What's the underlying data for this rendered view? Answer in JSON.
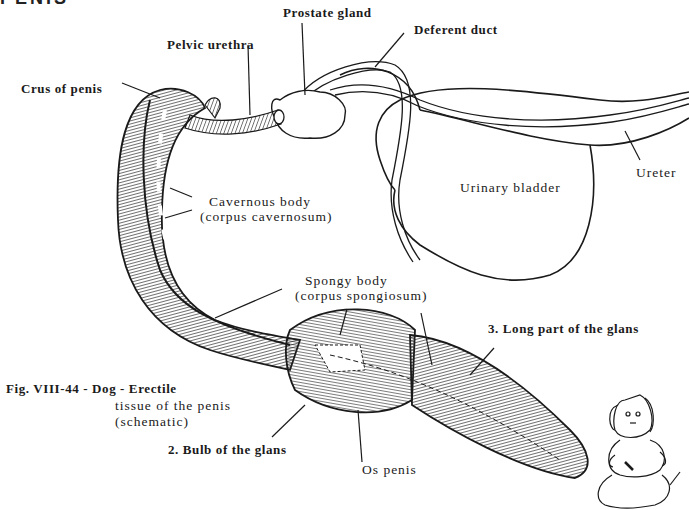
{
  "heading": "PENIS",
  "labels": {
    "prostate_gland": "Prostate gland",
    "deferent_duct": "Deferent duct",
    "pelvic_urethra": "Pelvic urethra",
    "crus_of_penis": "Crus of penis",
    "ureter": "Ureter",
    "urinary_bladder": "Urinary bladder",
    "cavernous_body_1": "Cavernous body",
    "cavernous_body_2": "(corpus cavernosum)",
    "spongy_body_1": "Spongy body",
    "spongy_body_2": "(corpus spongiosum)",
    "long_part_glans": "3. Long part of the glans",
    "bulb_glans": "2. Bulb of the glans",
    "os_penis": "Os penis"
  },
  "caption": {
    "line1": "Fig. VIII-44 - Dog - Erectile",
    "line2": "tissue of the penis",
    "line3": "(schematic)"
  },
  "colors": {
    "ink": "#1a1a1a",
    "paper": "#ffffff"
  }
}
